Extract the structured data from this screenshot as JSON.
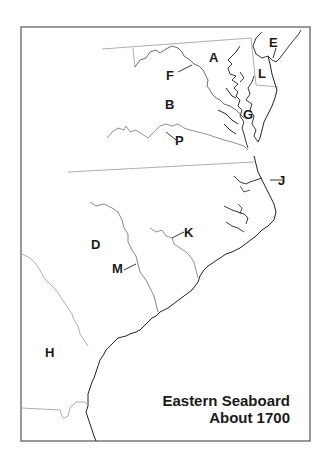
{
  "map": {
    "title_line1": "Eastern Seaboard",
    "title_line2": "About 1700",
    "colors": {
      "background": "#ffffff",
      "frame": "#555555",
      "boundary": "#999999",
      "coast": "#222222",
      "label": "#1a1a1a"
    },
    "labels": [
      {
        "id": "A",
        "text": "A"
      },
      {
        "id": "B",
        "text": "B"
      },
      {
        "id": "D",
        "text": "D"
      },
      {
        "id": "E",
        "text": "E"
      },
      {
        "id": "F",
        "text": "F"
      },
      {
        "id": "G",
        "text": "G"
      },
      {
        "id": "H",
        "text": "H"
      },
      {
        "id": "J",
        "text": "J"
      },
      {
        "id": "K",
        "text": "K"
      },
      {
        "id": "L",
        "text": "L"
      },
      {
        "id": "M",
        "text": "M"
      },
      {
        "id": "P",
        "text": "P"
      }
    ]
  }
}
